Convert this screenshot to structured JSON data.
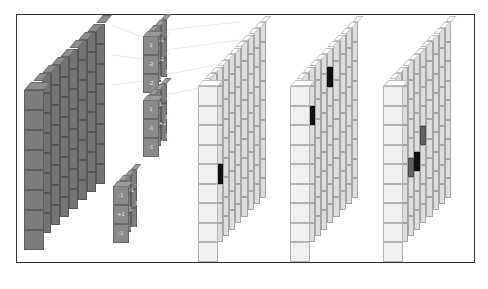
{
  "diagram": {
    "title": "",
    "colors": {
      "input": "#7d7d7d",
      "filter": "#8a8a8a",
      "feature_map": "#f0f0f0",
      "active_dark": "#111111",
      "active_mid": "#6a6a6a",
      "frame_border": "#333333"
    },
    "input_volume": {
      "rows": 8,
      "cols": 8,
      "depth": 1
    },
    "filters": [
      {
        "id": "filter-1",
        "front_labels": [
          "1",
          "-2",
          "-2"
        ],
        "side_labels": [
          "-1",
          "-2",
          "1",
          "-2",
          "-2",
          "1"
        ]
      },
      {
        "id": "filter-2",
        "front_labels": [
          "1",
          "-1",
          "-1"
        ],
        "side_labels": [
          "1",
          "+1",
          "-1",
          "-1",
          "1",
          "1"
        ]
      },
      {
        "id": "filter-3",
        "front_labels": [
          "-1",
          "+1",
          "-1"
        ],
        "side_labels": [
          "-1",
          "1",
          "+1",
          "-1",
          "1",
          "-1"
        ]
      }
    ],
    "feature_maps": [
      {
        "id": "map-1",
        "rows": 9,
        "cols": 9,
        "active": [
          {
            "r": 4,
            "c": 2,
            "shade": "mid"
          },
          {
            "r": 5,
            "c": 3,
            "shade": "dark"
          }
        ]
      },
      {
        "id": "map-2",
        "rows": 9,
        "cols": 9,
        "active": [
          {
            "r": 2,
            "c": 3,
            "shade": "dark"
          },
          {
            "r": 1,
            "c": 6,
            "shade": "dark"
          }
        ]
      },
      {
        "id": "map-3",
        "rows": 9,
        "cols": 9,
        "active": [
          {
            "r": 5,
            "c": 4,
            "shade": "mid"
          },
          {
            "r": 5,
            "c": 5,
            "shade": "dark"
          },
          {
            "r": 4,
            "c": 6,
            "shade": "mid"
          }
        ]
      }
    ]
  }
}
